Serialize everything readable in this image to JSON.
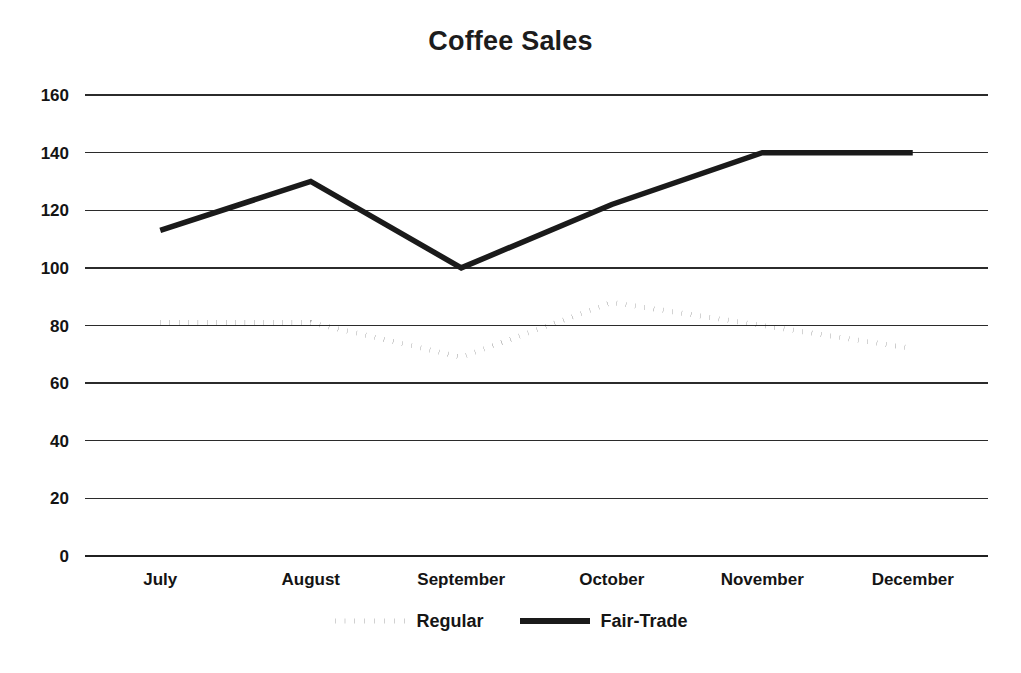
{
  "chart_data": {
    "type": "line",
    "title": "Coffee Sales",
    "xlabel": "",
    "ylabel": "",
    "categories": [
      "July",
      "August",
      "September",
      "October",
      "November",
      "December"
    ],
    "series": [
      {
        "name": "Regular",
        "style": "dotted",
        "color": "#1a1a1a",
        "values": [
          81,
          81,
          69,
          88,
          80,
          72
        ]
      },
      {
        "name": "Fair-Trade",
        "style": "solid",
        "color": "#1a1a1a",
        "values": [
          113,
          130,
          100,
          122,
          140,
          140
        ]
      }
    ],
    "ylim": [
      0,
      160
    ],
    "ytick_step": 20,
    "yticks": [
      0,
      20,
      40,
      60,
      80,
      100,
      120,
      140,
      160
    ],
    "ytick_labels": [
      "0",
      "20",
      "40",
      "60",
      "80",
      "100",
      "120",
      "140",
      "160"
    ],
    "grid": "horizontal",
    "legend_position": "bottom"
  },
  "legend": {
    "entries": [
      {
        "label": "Regular",
        "marker": "dotted-line-swatch"
      },
      {
        "label": "Fair-Trade",
        "marker": "solid-line-swatch"
      }
    ]
  }
}
